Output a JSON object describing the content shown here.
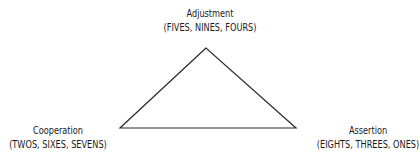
{
  "diagram": {
    "type": "triangle",
    "vertices": [
      {
        "id": "top",
        "title": "Adjustment",
        "subtitle": "(FIVES, NINES, FOURS)"
      },
      {
        "id": "left",
        "title": "Cooperation",
        "subtitle": "(TWOS, SIXES, SEVENS)"
      },
      {
        "id": "right",
        "title": "Assertion",
        "subtitle": "(EIGHTS, THREES, ONES)"
      }
    ],
    "edge_color": "#2a2a2a"
  }
}
